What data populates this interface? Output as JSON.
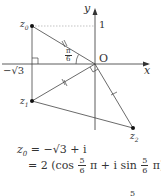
{
  "diagram": {
    "axes": {
      "x_label": "x",
      "y_label": "y",
      "origin_label": "O"
    },
    "ticks": {
      "x_neg": "−√3",
      "y_pos": "1"
    },
    "points": [
      {
        "label": "z0",
        "sub": "0",
        "x": 32,
        "y": 26
      },
      {
        "label": "z1",
        "sub": "1",
        "x": 32,
        "y": 101
      },
      {
        "label": "z2",
        "sub": "2",
        "x": 133,
        "y": 128
      }
    ],
    "angle_label": {
      "num": "π",
      "den": "6"
    },
    "colors": {
      "line": "#444444",
      "axis": "#333333",
      "dash": "#999999"
    }
  },
  "equations": {
    "line1": {
      "lhs": "z",
      "sub": "0",
      "rhs": "= −√3 + i"
    },
    "line2": {
      "prefix": "= 2 (cos",
      "frac1_num": "5",
      "frac1_den": "6",
      "mid": "π + i sin",
      "frac2_num": "5",
      "frac2_den": "6",
      "suffix": "π)"
    },
    "line3_partial": "5"
  }
}
